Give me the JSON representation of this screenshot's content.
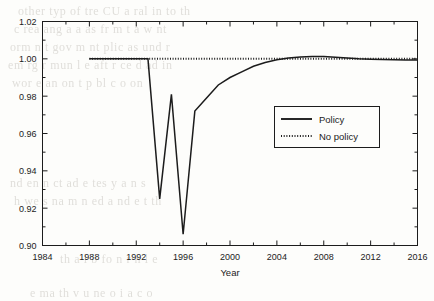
{
  "figure": {
    "background_color": "#fdfdfb",
    "ink_color": "#1c1c1c",
    "scan_artifact_color": "#c9c6c0"
  },
  "axis_titles": {
    "x": "Year",
    "y": ""
  },
  "background_artifacts": [
    {
      "text": "other   typ    of  tre   CU a     ral in   to th",
      "x": 18,
      "y": 4
    },
    {
      "text": "c rea ang  a a as fr m  t a  w  nt",
      "x": 14,
      "y": 22
    },
    {
      "text": "orm  n   t  gov  m nt  plic   as  und r",
      "x": 10,
      "y": 40
    },
    {
      "text": "em rg   r  mun  l  e aft r ce   d  ad  in",
      "x": 8,
      "y": 58
    },
    {
      "text": "wor e   an  on   t  p bl  c   o on",
      "x": 12,
      "y": 76
    },
    {
      "text": "nd en   n    ct   ad e tes    y   a n s",
      "x": 10,
      "y": 176
    },
    {
      "text": "h we     s  na   m  n  ed  a    nd   e t  th",
      "x": 14,
      "y": 194
    },
    {
      "text": "th  a l  b  fo n       r   n l  e",
      "x": 60,
      "y": 252
    },
    {
      "text": "e  ma   th    v  u   ne   o  i  a  c  o",
      "x": 30,
      "y": 286
    }
  ],
  "chart_data": {
    "type": "line",
    "title": "",
    "xlabel": "Year",
    "ylabel": "",
    "xlim": [
      1984,
      2016
    ],
    "ylim": [
      0.9,
      1.02
    ],
    "xticks": [
      1984,
      1988,
      1992,
      1996,
      2000,
      2004,
      2008,
      2012,
      2016
    ],
    "yticks": [
      0.9,
      0.92,
      0.94,
      0.96,
      0.98,
      1.0,
      1.02
    ],
    "xtick_labels": [
      "1984",
      "1988",
      "1992",
      "1996",
      "2000",
      "2004",
      "2008",
      "2012",
      "2016"
    ],
    "ytick_labels": [
      "0.90",
      "0.92",
      "0.94",
      "0.96",
      "0.98",
      "1.00",
      "1.02"
    ],
    "minor_ticks": true,
    "grid": false,
    "legend_position": "center-right",
    "series": [
      {
        "name": "Policy",
        "style": "solid",
        "color": "#1c1c1c",
        "x": [
          1988,
          1989,
          1990,
          1991,
          1992,
          1993,
          1994,
          1995,
          1996,
          1997,
          1998,
          1999,
          2000,
          2001,
          2002,
          2003,
          2004,
          2005,
          2006,
          2007,
          2008,
          2009,
          2010,
          2011,
          2012,
          2013,
          2014,
          2015,
          2016
        ],
        "values": [
          1.0,
          1.0,
          1.0,
          1.0,
          1.0,
          1.0,
          0.925,
          0.981,
          0.906,
          0.972,
          0.979,
          0.986,
          0.99,
          0.993,
          0.996,
          0.998,
          0.9995,
          1.0005,
          1.001,
          1.0012,
          1.0012,
          1.0008,
          1.0004,
          1.0,
          0.9998,
          0.9996,
          0.9995,
          0.9994,
          0.9994
        ]
      },
      {
        "name": "No policy",
        "style": "dotted",
        "color": "#1c1c1c",
        "x": [
          1988,
          1992,
          1993,
          1996,
          2000,
          2004,
          2008,
          2012,
          2016
        ],
        "values": [
          1.0,
          1.0,
          1.0,
          1.0,
          1.0,
          1.0,
          1.0,
          1.0,
          1.0
        ]
      }
    ]
  },
  "legend": {
    "entries": [
      {
        "label": "Policy",
        "style": "solid"
      },
      {
        "label": "No policy",
        "style": "dotted"
      }
    ]
  }
}
